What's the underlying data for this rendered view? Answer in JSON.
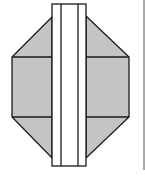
{
  "figure": {
    "colors": {
      "background": "#ffffff",
      "fill": "#c4c4c4",
      "stroke": "#1a1a1a",
      "border": "#555555"
    },
    "octagon": {
      "left_x": 12,
      "right_x": 129,
      "upper_y": 57,
      "lower_y": 117,
      "top_y": 16,
      "bottom_y": 158
    },
    "strip": {
      "outer_left_x": 52,
      "outer_right_x": 86,
      "inner_left_x": 61,
      "inner_right_x": 78,
      "top_y": 4,
      "bottom_y": 166
    },
    "right_border_x": 144
  }
}
